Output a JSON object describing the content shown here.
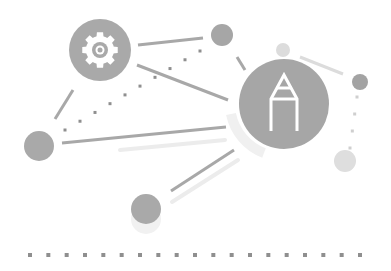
{
  "illustration": {
    "title": "Settings and editing network illustration",
    "colors": {
      "background": "#ffffff",
      "node_dark": "#a6a6a6",
      "node_mid": "#b0b0b0",
      "node_light": "#d9d9d9",
      "line": "#a8a8a8",
      "line_faint": "#ececec",
      "dot": "#8f8f8f",
      "icon": "#ffffff"
    },
    "nodes": [
      {
        "name": "gear-node",
        "cx": 100,
        "cy": 50,
        "r": 31,
        "fill": "#a9a9a9",
        "icon": "gear-icon"
      },
      {
        "name": "pencil-node",
        "cx": 284,
        "cy": 104,
        "r": 45,
        "fill": "#a6a6a6",
        "icon": "pencil-icon"
      },
      {
        "name": "top-small-node",
        "cx": 222,
        "cy": 35,
        "r": 11,
        "fill": "#a6a6a6"
      },
      {
        "name": "faint-top-node",
        "cx": 283,
        "cy": 50,
        "r": 7,
        "fill": "#dcdcdc"
      },
      {
        "name": "right-small-node",
        "cx": 360,
        "cy": 82,
        "r": 8,
        "fill": "#a3a3a3"
      },
      {
        "name": "right-faint-node",
        "cx": 345,
        "cy": 161,
        "r": 11,
        "fill": "#dedede"
      },
      {
        "name": "left-node",
        "cx": 39,
        "cy": 146,
        "r": 15,
        "fill": "#a9a9a9"
      },
      {
        "name": "bottom-node",
        "cx": 146,
        "cy": 209,
        "r": 15,
        "fill": "#a9a9a9"
      }
    ],
    "lines": [
      {
        "name": "gear-to-top-line",
        "x1": 138,
        "y1": 45,
        "x2": 203,
        "y2": 38,
        "w": 3
      },
      {
        "name": "gear-to-pencil-line",
        "x1": 137,
        "y1": 65,
        "x2": 228,
        "y2": 100,
        "w": 3
      },
      {
        "name": "left-slant-line",
        "x1": 55,
        "y1": 119,
        "x2": 73,
        "y2": 90,
        "w": 3
      },
      {
        "name": "left-to-pencil-line",
        "x1": 62,
        "y1": 143,
        "x2": 226,
        "y2": 127,
        "w": 3
      },
      {
        "name": "bottom-to-pencil-line",
        "x1": 171,
        "y1": 191,
        "x2": 234,
        "y2": 150,
        "w": 3
      },
      {
        "name": "top-to-pencil-line",
        "x1": 237,
        "y1": 57,
        "x2": 245,
        "y2": 70,
        "w": 3
      },
      {
        "name": "faint-to-right-line",
        "x1": 300,
        "y1": 57,
        "x2": 343,
        "y2": 74,
        "w": 3,
        "faint": true
      }
    ],
    "faint_lines": [
      {
        "name": "left-shadow-line",
        "x1": 120,
        "y1": 150,
        "x2": 225,
        "y2": 140,
        "w": 4
      },
      {
        "name": "bottom-shadow-line",
        "x1": 172,
        "y1": 202,
        "x2": 238,
        "y2": 160,
        "w": 4
      }
    ],
    "dotted_paths": [
      {
        "name": "gear-dotted-path",
        "x1": 65,
        "y1": 130,
        "x2": 200,
        "y2": 51,
        "count": 10,
        "size": 3
      },
      {
        "name": "right-dotted-path",
        "x1": 357,
        "y1": 97,
        "x2": 350,
        "y2": 148,
        "count": 4,
        "size": 3
      }
    ],
    "baseline_dots": {
      "name": "baseline-dots",
      "x_start": 30,
      "x_end": 360,
      "y": 255,
      "count": 19,
      "size": 4
    }
  }
}
